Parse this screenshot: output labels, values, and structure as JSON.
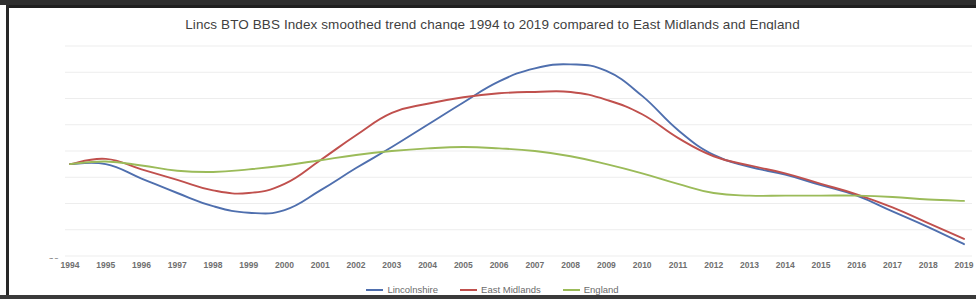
{
  "chart_data": {
    "type": "line",
    "title": "Lincs BTO BBS Index smoothed trend change 1994 to 2019 compared to East Midlands and England",
    "xlabel": "",
    "ylabel": "% increase / decrease since 1994",
    "grid": true,
    "legend_position": "bottom",
    "ylim": [
      30,
      190
    ],
    "ytick_step": 20,
    "yticks": [
      190,
      170,
      150,
      130,
      110,
      90,
      70,
      50,
      30
    ],
    "categories": [
      "1994",
      "1995",
      "1996",
      "1997",
      "1998",
      "1999",
      "2000",
      "2001",
      "2002",
      "2003",
      "2004",
      "2005",
      "2006",
      "2007",
      "2008",
      "2009",
      "2010",
      "2011",
      "2012",
      "2013",
      "2014",
      "2015",
      "2016",
      "2017",
      "2018",
      "2019"
    ],
    "series": [
      {
        "name": "Lincolnshire",
        "color": "#4f6fae",
        "values": [
          100,
          100,
          89,
          78,
          68,
          63,
          65,
          80,
          97,
          113,
          130,
          147,
          163,
          173,
          176,
          171,
          152,
          126,
          107,
          98,
          92,
          84,
          76,
          64,
          52,
          39
        ]
      },
      {
        "name": "East Midlands",
        "color": "#c0504d",
        "values": [
          100,
          104,
          96,
          88,
          80,
          78,
          85,
          103,
          122,
          139,
          146,
          151,
          154,
          155,
          155,
          149,
          138,
          120,
          106,
          99,
          93,
          85,
          77,
          67,
          55,
          43
        ]
      },
      {
        "name": "England",
        "color": "#9bbb59",
        "values": [
          100,
          102,
          99,
          95,
          94,
          96,
          99,
          103,
          107,
          110,
          112,
          113,
          112,
          110,
          106,
          100,
          93,
          85,
          78,
          76,
          76,
          76,
          76,
          75,
          73,
          72
        ]
      }
    ]
  }
}
